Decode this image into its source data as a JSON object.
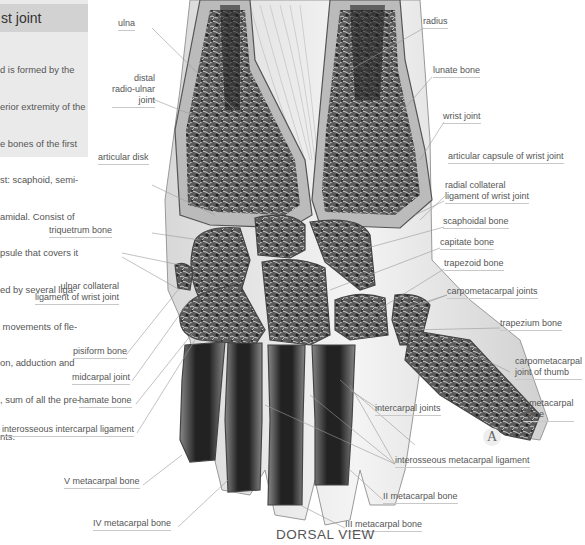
{
  "infobox": {
    "title": "st joint",
    "text_lines": [
      "d is formed by the",
      "erior extremity of the",
      "e bones of the first",
      "st: scaphoid, semi-",
      "amidal. Consist of",
      "psule that covers it",
      "ed by several liga-",
      " movements of fle-",
      "on, adduction and",
      ", sum of all the pre-",
      "nts."
    ]
  },
  "view_title": "DORSAL VIEW",
  "figure_mark": "A",
  "labels": {
    "ulna": "ulna",
    "distal_radio_ulnar_joint": [
      "distal",
      "radio-ulnar",
      "joint"
    ],
    "articular_disk": "articular disk",
    "triquetrum_bone": "triquetrum bone",
    "ulnar_collateral_ligament": [
      "ulnar collateral",
      "ligament of wrist joint"
    ],
    "pisiform_bone": "pisiform bone",
    "midcarpal_joint": "midcarpal joint",
    "hamate_bone": "hamate bone",
    "interosseous_intercarpal_ligament": "interosseous intercarpal ligament",
    "v_metacarpal_bone": "V metacarpal bone",
    "iv_metacarpal_bone": "IV metacarpal bone",
    "radius": "radius",
    "lunate_bone": "lunate bone",
    "wrist_joint": "wrist joint",
    "articular_capsule": "articular capsule of wrist joint",
    "radial_collateral_ligament": [
      "radial collateral",
      "ligament of wrist joint"
    ],
    "scaphoidal_bone": "scaphoidal bone",
    "capitate_bone": "capitate bone",
    "trapezoid_bone": "trapezoid bone",
    "carpometacarpal_joints": "carpometacarpal joints",
    "trapezium_bone": "trapezium bone",
    "carpometacarpal_joint_of_thumb": [
      "carpometacarpal",
      "joint of thumb"
    ],
    "i_metacarpal_bone": [
      "I metacarpal",
      "bone"
    ],
    "intercarpal_joints": "intercarpal joints",
    "interosseous_metacarpal_ligament": "interosseous metacarpal ligament",
    "ii_metacarpal_bone": "II metacarpal bone",
    "iii_metacarpal_bone": "III metacarpal bone"
  }
}
